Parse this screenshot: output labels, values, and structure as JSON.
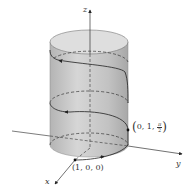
{
  "diagram": {
    "axes": {
      "x_label": "x",
      "y_label": "y",
      "z_label": "z"
    },
    "points": [
      {
        "label": "(1, 0, 0)",
        "text": "(1, 0, 0)"
      },
      {
        "label": "(0, 1, π/2)",
        "prefix": "0, 1,",
        "num": "π",
        "den": "2"
      }
    ],
    "colors": {
      "cylinder_fill": "#c8c8c8",
      "cylinder_top": "#dcdcdc",
      "axis": "#333333",
      "curve": "#222222"
    }
  }
}
